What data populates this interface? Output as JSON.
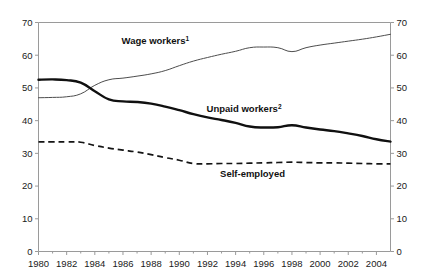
{
  "chart_data": {
    "type": "line",
    "title": "",
    "subtitle": "",
    "xlabel": "",
    "ylabel": "",
    "xlim": [
      1980,
      2005
    ],
    "ylim": [
      0,
      70
    ],
    "grid": false,
    "legend_position": "inline-annotations",
    "y_ticks": [
      0,
      10,
      20,
      30,
      40,
      50,
      60,
      70
    ],
    "y_ticks_right": [
      0,
      10,
      20,
      30,
      40,
      50,
      60,
      70
    ],
    "x_ticks": [
      1980,
      1982,
      1984,
      1986,
      1988,
      1990,
      1992,
      1994,
      1996,
      1998,
      2000,
      2002,
      2004
    ],
    "x_minor_ticks": [
      1981,
      1983,
      1985,
      1987,
      1989,
      1991,
      1993,
      1995,
      1997,
      1999,
      2001,
      2003,
      2005
    ],
    "x": [
      1980,
      1981,
      1982,
      1983,
      1984,
      1985,
      1986,
      1987,
      1988,
      1989,
      1990,
      1991,
      1992,
      1993,
      1994,
      1995,
      1996,
      1997,
      1998,
      1999,
      2000,
      2001,
      2002,
      2003,
      2004,
      2005
    ],
    "series": [
      {
        "name": "Wage workers",
        "footnote": "1",
        "style": "thin-solid",
        "color": "#4d4d4d",
        "values": [
          47.0,
          47.1,
          47.3,
          48.2,
          50.8,
          52.5,
          53.0,
          53.6,
          54.3,
          55.3,
          56.8,
          58.2,
          59.3,
          60.3,
          61.2,
          62.3,
          62.5,
          62.3,
          61.1,
          62.3,
          63.1,
          63.7,
          64.3,
          64.9,
          65.6,
          66.4
        ]
      },
      {
        "name": "Unpaid workers",
        "footnote": "2",
        "style": "thick-solid",
        "color": "#101010",
        "values": [
          52.5,
          52.6,
          52.4,
          51.6,
          49.0,
          46.5,
          45.9,
          45.7,
          45.2,
          44.3,
          43.2,
          42.0,
          41.0,
          40.2,
          39.3,
          38.2,
          37.9,
          38.0,
          38.6,
          37.9,
          37.3,
          36.8,
          36.1,
          35.3,
          34.3,
          33.6
        ]
      },
      {
        "name": "Self-employed",
        "footnote": "",
        "style": "dashed",
        "color": "#141414",
        "values": [
          33.5,
          33.5,
          33.5,
          33.4,
          32.4,
          31.6,
          31.0,
          30.4,
          29.6,
          28.7,
          27.9,
          26.9,
          26.8,
          26.9,
          26.9,
          27.0,
          27.1,
          27.2,
          27.3,
          27.2,
          27.1,
          27.1,
          27.0,
          26.9,
          26.8,
          26.8
        ]
      }
    ],
    "annotations": [
      {
        "id": "wage-workers-label",
        "text": "Wage workers",
        "sup": "1",
        "x": 1988.3,
        "y": 63.5
      },
      {
        "id": "unpaid-workers-label",
        "text": "Unpaid workers",
        "sup": "2",
        "x": 1994.6,
        "y": 42.5
      },
      {
        "id": "self-employed-label",
        "text": "Self-employed",
        "sup": "",
        "x": 1995.2,
        "y": 22.8
      }
    ]
  },
  "axes": {
    "left_labels": [
      "70",
      "60",
      "50",
      "40",
      "30",
      "20",
      "10",
      "0"
    ],
    "right_labels": [
      "70",
      "60",
      "50",
      "40",
      "30",
      "20",
      "10",
      "0"
    ],
    "bottom_labels": [
      "1980",
      "1982",
      "1984",
      "1986",
      "1988",
      "1990",
      "1992",
      "1994",
      "1996",
      "1998",
      "2000",
      "2002",
      "2004"
    ]
  },
  "colors": {
    "background": "#ffffff",
    "axis": "#9a9a9a",
    "wage_workers": "#4d4d4d",
    "unpaid_workers": "#101010",
    "self_employed": "#141414",
    "text": "#1a1a1a"
  }
}
